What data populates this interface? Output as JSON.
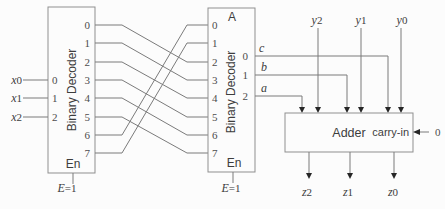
{
  "left_decoder": {
    "title": "Binary Decoder",
    "inputs": [
      {
        "v": "x",
        "s": "0"
      },
      {
        "v": "x",
        "s": "1"
      },
      {
        "v": "x",
        "s": "2"
      }
    ],
    "input_pins": [
      "0",
      "1",
      "2"
    ],
    "output_pins": [
      "0",
      "1",
      "2",
      "3",
      "4",
      "5",
      "6",
      "7"
    ],
    "enable_label": "En",
    "enable_value": {
      "v": "E",
      "s": "=1"
    }
  },
  "middle_decoder": {
    "corner_label": "A",
    "title": "Binary Decoder",
    "input_pins": [
      "0",
      "1",
      "2",
      "3",
      "4",
      "5",
      "6",
      "7"
    ],
    "output_pins": [
      "0",
      "1",
      "2"
    ],
    "output_wires": [
      "c",
      "b",
      "a"
    ],
    "enable_label": "En",
    "enable_value": {
      "v": "E",
      "s": "=1"
    }
  },
  "adder": {
    "label": "Adder",
    "carry_in_label": "carry-in",
    "carry_in_value": "0",
    "y_inputs": [
      {
        "v": "y",
        "s": "2"
      },
      {
        "v": "y",
        "s": "1"
      },
      {
        "v": "y",
        "s": "0"
      }
    ],
    "z_outputs": [
      {
        "v": "z",
        "s": "2"
      },
      {
        "v": "z",
        "s": "1"
      },
      {
        "v": "z",
        "s": "0"
      }
    ]
  },
  "colors": {
    "background": "#fcfcfc",
    "wire": "#7b7b7b",
    "box_border": "#8f8f8f",
    "text": "#3d3d3d",
    "arrowhead": "#262626"
  }
}
